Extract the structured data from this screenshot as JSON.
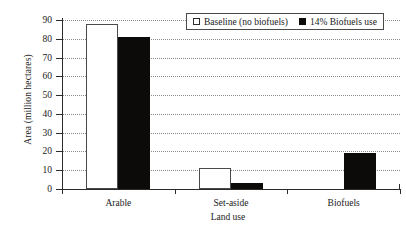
{
  "chart_data": {
    "type": "bar",
    "title": "",
    "xlabel": "Land use",
    "ylabel": "Area (million hectares)",
    "categories": [
      "Arable",
      "Set-aside",
      "Biofuels"
    ],
    "series": [
      {
        "name": "Baseline (no biofuels)",
        "values": [
          88,
          11,
          0
        ],
        "color": "#ffffff",
        "style": "open"
      },
      {
        "name": "14% Biofuels use",
        "values": [
          81,
          3,
          19
        ],
        "color": "#0d0a0a",
        "style": "filled"
      }
    ],
    "ylim": [
      0,
      90
    ],
    "ytick_labels": [
      "90",
      "80",
      "70",
      "60",
      "50",
      "40",
      "30",
      "20",
      "10",
      "0"
    ],
    "ytick_values": [
      90,
      80,
      70,
      60,
      50,
      40,
      30,
      20,
      10,
      0
    ],
    "grid": "horizontal-dotted",
    "legend_position": "top-right",
    "legend_boxed": true
  },
  "legend": {
    "entries": [
      {
        "label": "Baseline (no biofuels)",
        "swatch": "open-square-icon"
      },
      {
        "label": "14% Biofuels use",
        "swatch": "filled-square-icon"
      }
    ]
  }
}
